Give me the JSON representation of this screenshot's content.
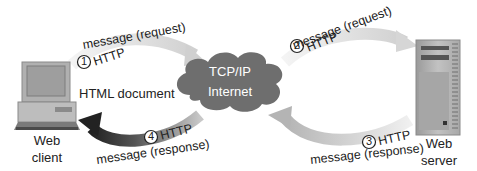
{
  "nodes": {
    "client": {
      "label_line1": "Web",
      "label_line2": "client",
      "icon": "desktop-computer-icon"
    },
    "internet": {
      "line1": "TCP/IP",
      "line2": "Internet",
      "icon": "cloud-icon"
    },
    "server": {
      "label_line1": "Web",
      "label_line2": "server",
      "icon": "tower-server-icon"
    }
  },
  "document_label": "HTML document",
  "arrows": [
    {
      "step": "1",
      "protocol": "HTTP",
      "message": "message (request)",
      "from": "client",
      "to": "internet"
    },
    {
      "step": "2",
      "protocol": "HTTP",
      "message": "message (request)",
      "from": "internet",
      "to": "server"
    },
    {
      "step": "3",
      "protocol": "HTTP",
      "message": "message (response)",
      "from": "server",
      "to": "internet"
    },
    {
      "step": "4",
      "protocol": "HTTP",
      "message": "message (response)",
      "from": "internet",
      "to": "client"
    }
  ],
  "colors": {
    "request_arrow": "#d6d6d6",
    "response_arrow_light": "#c4c4c4",
    "response_arrow_dark": "#3a3a3a",
    "cloud": "#6e6e6e",
    "device": "#b8b8b8"
  }
}
